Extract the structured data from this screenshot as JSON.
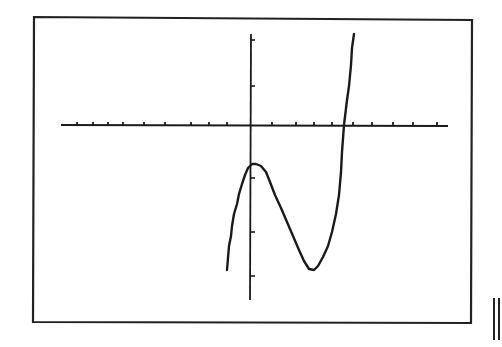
{
  "chart_data": {
    "type": "line",
    "title": "",
    "xlabel": "",
    "ylabel": "",
    "grid": false,
    "legend": false,
    "colors": {
      "background": "#ffffff",
      "ink": "#1a1a1a",
      "frame": "#222222"
    },
    "axes": {
      "x_axis_pixel": {
        "y": 125,
        "x_start": 61,
        "x_end": 448
      },
      "y_axis_pixel": {
        "x": 251,
        "y_start": 34,
        "y_end": 300
      },
      "x_ticks_left_px": [
        77,
        93,
        108,
        123,
        144,
        165,
        191,
        209,
        227
      ],
      "x_ticks_right_px": [
        272,
        296,
        314,
        332,
        353,
        372,
        393,
        413,
        437
      ],
      "y_ticks_px": [
        40,
        86,
        178,
        232,
        276
      ],
      "tick_labels": []
    },
    "curve_px": [
      [
        227,
        270
      ],
      [
        228,
        258
      ],
      [
        229,
        246
      ],
      [
        231,
        236
      ],
      [
        232,
        226
      ],
      [
        234,
        214
      ],
      [
        237,
        204
      ],
      [
        239,
        194
      ],
      [
        242,
        184
      ],
      [
        245,
        175
      ],
      [
        248,
        168
      ],
      [
        252,
        164
      ],
      [
        256,
        164
      ],
      [
        261,
        166
      ],
      [
        266,
        172
      ],
      [
        270,
        182
      ],
      [
        275,
        195
      ],
      [
        281,
        208
      ],
      [
        287,
        222
      ],
      [
        293,
        236
      ],
      [
        299,
        250
      ],
      [
        304,
        261
      ],
      [
        309,
        269
      ],
      [
        314,
        270
      ],
      [
        318,
        266
      ],
      [
        323,
        257
      ],
      [
        328,
        246
      ],
      [
        332,
        232
      ],
      [
        336,
        214
      ],
      [
        339,
        195
      ],
      [
        341,
        172
      ],
      [
        342,
        152
      ],
      [
        344,
        125
      ],
      [
        347,
        100
      ],
      [
        349,
        86
      ],
      [
        351,
        65
      ],
      [
        352,
        48
      ],
      [
        354,
        34
      ]
    ],
    "features": {
      "local_max_px": [
        254,
        164
      ],
      "local_min_px": [
        313,
        270
      ],
      "x_intercept_px": [
        344,
        125
      ]
    }
  },
  "screen": {
    "frame_px": {
      "left": 33,
      "top": 17,
      "right": 472,
      "bottom": 323
    },
    "marker_symbol": "||"
  }
}
